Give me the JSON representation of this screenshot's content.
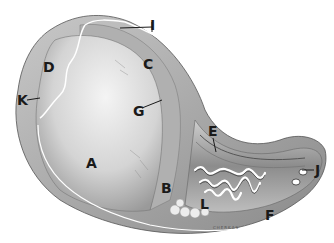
{
  "figure": {
    "type": "anatomical-illustration",
    "colors": {
      "background": "#ffffff",
      "ink": "#1a1a1a",
      "tissue_light": "#e6e6e6",
      "tissue_mid": "#b5b5b5",
      "tissue_dark": "#6e6e6e"
    },
    "labels": [
      {
        "id": "A",
        "text": "A",
        "x": 86,
        "y": 156
      },
      {
        "id": "B",
        "text": "B",
        "x": 161,
        "y": 181
      },
      {
        "id": "C",
        "text": "C",
        "x": 143,
        "y": 57
      },
      {
        "id": "D",
        "text": "D",
        "x": 43,
        "y": 60
      },
      {
        "id": "E",
        "text": "E",
        "x": 208,
        "y": 124
      },
      {
        "id": "F",
        "text": "F",
        "x": 265,
        "y": 208
      },
      {
        "id": "G",
        "text": "G",
        "x": 133,
        "y": 104
      },
      {
        "id": "I",
        "text": "I",
        "x": 152,
        "y": 22
      },
      {
        "id": "J",
        "text": "J",
        "x": 315,
        "y": 168
      },
      {
        "id": "K",
        "text": "K",
        "x": 17,
        "y": 96
      },
      {
        "id": "L",
        "text": "L",
        "x": 200,
        "y": 197
      }
    ],
    "signature": "CHERKAS"
  }
}
